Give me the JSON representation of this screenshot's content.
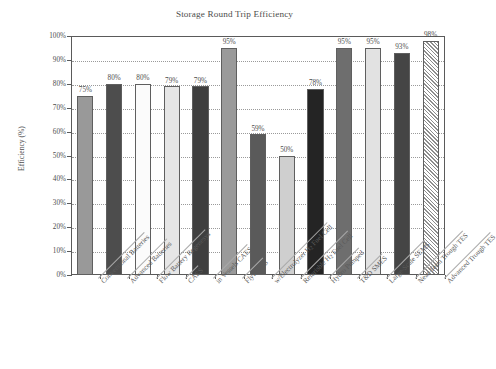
{
  "chart_data": {
    "type": "bar",
    "title": "Storage Round Trip Efficiency",
    "xlabel": "",
    "ylabel": "Efficiency (%)",
    "ylim": [
      0,
      100
    ],
    "grid": true,
    "legend": "none",
    "y_ticks": [
      "0%",
      "10%",
      "20%",
      "30%",
      "40%",
      "50%",
      "60%",
      "70%",
      "80%",
      "90%",
      "100%"
    ],
    "y_tick_values": [
      0,
      10,
      20,
      30,
      40,
      50,
      60,
      70,
      80,
      90,
      100
    ],
    "categories": [
      "Conventional Batteries",
      "Advanced Batteries",
      "Flow Battery Regenesys",
      "CAES",
      "in Vessels CAES",
      "Flywheels",
      "w/Electrolyzer H2 Fuel Cell",
      "Referisble H2 Fuel Cell",
      "Hydro Pumped",
      "T&D SMES",
      "Large-Scale SEMS",
      "Near-Term Trough TES",
      "Advanced Trough TES"
    ],
    "values": [
      75,
      80,
      80,
      79,
      79,
      95,
      59,
      50,
      78,
      95,
      95,
      93,
      98
    ],
    "data_labels": [
      "75%",
      "80%",
      "80%",
      "79%",
      "79%",
      "95%",
      "59%",
      "50%",
      "78%",
      "95%",
      "95%",
      "93%",
      "98%"
    ],
    "bar_fills": [
      "#999999",
      "#4d4d4d",
      "#fbfbfb",
      "#e6e6e6",
      "#3f3f3f",
      "#9a9a9a",
      "#5a5a5a",
      "#cfcfcf",
      "#242424",
      "#6e6e6e",
      "#e2e2e2",
      "#454545",
      "hatch"
    ]
  },
  "colors": {
    "axis": "#5a5a5a",
    "grid": "#9a9a9a",
    "text": "#4d4d4d",
    "background": "#ffffff",
    "bar_edge": "#5f5f5f"
  }
}
